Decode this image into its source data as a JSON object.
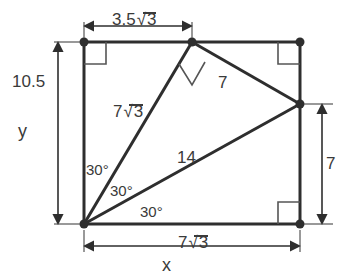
{
  "figure": {
    "background_color": "#ffffff",
    "stroke_color": "#2e2e2e",
    "thin_stroke_color": "#555555",
    "text_color": "#3a3a3a"
  },
  "dimensions": {
    "top": {
      "name": "top-dimension",
      "value": "3.5",
      "radicand": "3",
      "full_text": "3.5√3"
    },
    "left": {
      "name": "left-dimension",
      "value": "10.5",
      "full_text": "10.5"
    },
    "right": {
      "name": "right-dimension",
      "value": "7",
      "full_text": "7"
    },
    "bottom": {
      "name": "bottom-dimension",
      "value": "7",
      "radicand": "3",
      "full_text": "7√3"
    }
  },
  "axes": {
    "x_label": "x",
    "y_label": "y"
  },
  "segments": [
    {
      "name": "segment-7root3",
      "label": "7",
      "radicand": "3",
      "full_text": "7√3"
    },
    {
      "name": "segment-7",
      "label": "7",
      "full_text": "7"
    },
    {
      "name": "segment-14",
      "label": "14",
      "full_text": "14"
    }
  ],
  "angles": [
    {
      "name": "angle-upper",
      "label": "30°"
    },
    {
      "name": "angle-middle",
      "label": "30°"
    },
    {
      "name": "angle-lower",
      "label": "30°"
    }
  ],
  "vertices": [
    {
      "name": "vertex-top-left",
      "x": 84,
      "y": 42
    },
    {
      "name": "vertex-top-middle",
      "x": 192,
      "y": 42
    },
    {
      "name": "vertex-top-right",
      "x": 300,
      "y": 42
    },
    {
      "name": "vertex-right-middle",
      "x": 300,
      "y": 104
    },
    {
      "name": "vertex-bottom-right",
      "x": 300,
      "y": 224
    },
    {
      "name": "vertex-bottom-left",
      "x": 84,
      "y": 224
    }
  ],
  "right_angle_markers": [
    {
      "name": "right-angle-top-left"
    },
    {
      "name": "right-angle-top-right"
    },
    {
      "name": "right-angle-bottom-right"
    },
    {
      "name": "right-angle-top-middle-rotated"
    }
  ]
}
